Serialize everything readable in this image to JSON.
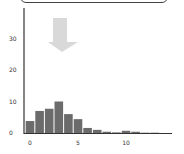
{
  "chart_data": {
    "type": "bar",
    "title": "",
    "xlabel": "",
    "ylabel": "",
    "categories": [
      0,
      1,
      2,
      3,
      4,
      5,
      6,
      7,
      8,
      9,
      10,
      11,
      12,
      13
    ],
    "values": [
      3.8,
      7,
      7.7,
      10,
      6,
      4.4,
      1.6,
      1,
      0.4,
      0.2,
      0.7,
      0.4,
      0.1,
      0.1
    ],
    "x_ticks": [
      "0",
      "5",
      "10"
    ],
    "y_ticks": [
      "0",
      "10",
      "20",
      "30"
    ],
    "ylim": [
      0,
      35
    ],
    "xlim": [
      -0.6,
      14.5
    ],
    "grid": false,
    "legend": null,
    "annotations": [
      {
        "type": "arrow",
        "direction": "down",
        "color": "#d9d9d9",
        "x_approx": 3.3,
        "y_from": 36,
        "y_to": 26
      }
    ],
    "bar_color": "#6b6b6b"
  }
}
